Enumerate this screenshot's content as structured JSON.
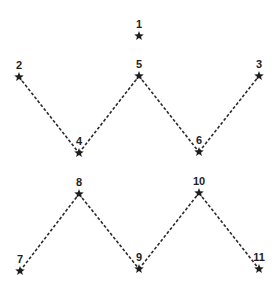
{
  "diagram": {
    "type": "connect-the-dots",
    "nodes": [
      {
        "id": "1",
        "label": "1"
      },
      {
        "id": "2",
        "label": "2"
      },
      {
        "id": "3",
        "label": "3"
      },
      {
        "id": "4",
        "label": "4"
      },
      {
        "id": "5",
        "label": "5"
      },
      {
        "id": "6",
        "label": "6"
      },
      {
        "id": "7",
        "label": "7"
      },
      {
        "id": "8",
        "label": "8"
      },
      {
        "id": "9",
        "label": "9"
      },
      {
        "id": "10",
        "label": "10"
      },
      {
        "id": "11",
        "label": "11"
      }
    ],
    "edges": [
      {
        "from": "2",
        "to": "4",
        "style": "dashed"
      },
      {
        "from": "4",
        "to": "5",
        "style": "dashed"
      },
      {
        "from": "5",
        "to": "6",
        "style": "dashed"
      },
      {
        "from": "6",
        "to": "3",
        "style": "dashed"
      },
      {
        "from": "7",
        "to": "8",
        "style": "dashed"
      },
      {
        "from": "8",
        "to": "9",
        "style": "dashed"
      },
      {
        "from": "9",
        "to": "10",
        "style": "dashed"
      },
      {
        "from": "10",
        "to": "11",
        "style": "dashed"
      }
    ],
    "marker": "star-icon",
    "colors": {
      "ink": "#1e1e1e"
    }
  }
}
